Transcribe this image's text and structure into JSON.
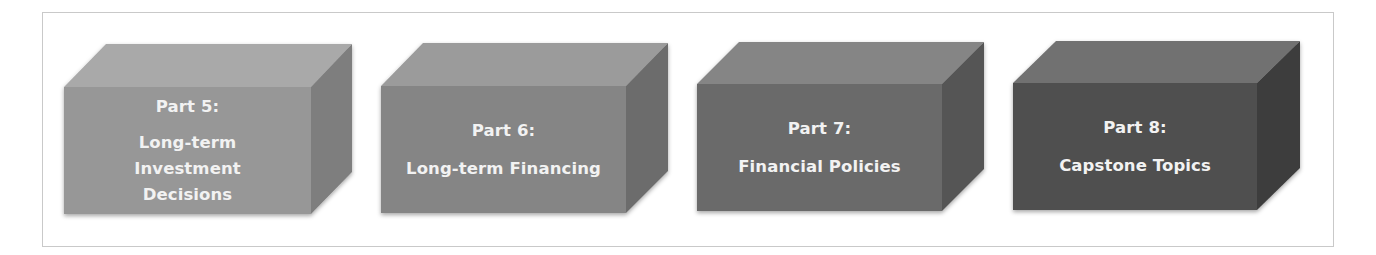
{
  "diagram": {
    "type": "sequence-of-3d-blocks",
    "blocks": [
      {
        "part": "Part 5:",
        "title_lines": [
          "Long-term",
          "Investment",
          "Decisions"
        ],
        "colors": {
          "top": "#a9a9a9",
          "front": "#979797",
          "side": "#7e7e7e"
        }
      },
      {
        "part": "Part 6:",
        "title_lines": [
          "Long-term Financing"
        ],
        "colors": {
          "top": "#9b9b9b",
          "front": "#858585",
          "side": "#6c6c6c"
        }
      },
      {
        "part": "Part 7:",
        "title_lines": [
          "Financial Policies"
        ],
        "colors": {
          "top": "#858585",
          "front": "#6a6a6a",
          "side": "#555555"
        }
      },
      {
        "part": "Part 8:",
        "title_lines": [
          "Capstone Topics"
        ],
        "colors": {
          "top": "#717171",
          "front": "#4f4f4f",
          "side": "#3e3e3e"
        }
      }
    ]
  }
}
